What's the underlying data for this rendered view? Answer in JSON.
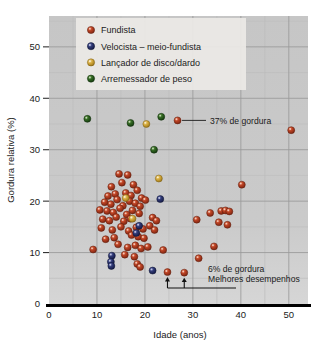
{
  "chart_data": {
    "type": "scatter",
    "title": "",
    "xlabel": "Idade (anos)",
    "ylabel": "Gordura relativa (%)",
    "xlim": [
      0,
      54
    ],
    "ylim": [
      0,
      56
    ],
    "xticks": [
      0,
      10,
      20,
      30,
      40,
      50
    ],
    "yticks": [
      0,
      10,
      20,
      30,
      40,
      50
    ],
    "grid": true,
    "grid_minor": true,
    "legend_position": "top-left",
    "plot_background": "#c9c9c9",
    "series": [
      {
        "name": "Fundista",
        "key": "fundista",
        "color": "#a8321e",
        "points": [
          [
            26.8,
            35.7
          ],
          [
            50.5,
            33.8
          ],
          [
            14.6,
            25.3
          ],
          [
            16.4,
            25.1
          ],
          [
            13.0,
            22.8
          ],
          [
            15.2,
            23.6
          ],
          [
            17.6,
            23.2
          ],
          [
            40.2,
            23.2
          ],
          [
            12.3,
            21.0
          ],
          [
            13.8,
            21.4
          ],
          [
            16.0,
            21.6
          ],
          [
            17.1,
            21.1
          ],
          [
            18.4,
            22.1
          ],
          [
            19.3,
            20.6
          ],
          [
            11.6,
            19.8
          ],
          [
            12.9,
            19.4
          ],
          [
            14.2,
            20.3
          ],
          [
            15.4,
            19.1
          ],
          [
            16.8,
            20.0
          ],
          [
            18.0,
            19.6
          ],
          [
            19.0,
            19.0
          ],
          [
            20.1,
            20.2
          ],
          [
            10.6,
            18.3
          ],
          [
            12.1,
            18.1
          ],
          [
            13.4,
            17.8
          ],
          [
            14.8,
            18.6
          ],
          [
            16.2,
            17.4
          ],
          [
            17.4,
            18.2
          ],
          [
            18.8,
            17.6
          ],
          [
            33.6,
            17.7
          ],
          [
            35.9,
            18.1
          ],
          [
            36.8,
            18.2
          ],
          [
            37.6,
            18.0
          ],
          [
            11.2,
            16.5
          ],
          [
            12.6,
            16.2
          ],
          [
            14.0,
            16.9
          ],
          [
            15.6,
            16.1
          ],
          [
            17.0,
            16.6
          ],
          [
            21.6,
            16.8
          ],
          [
            22.4,
            16.2
          ],
          [
            30.8,
            16.4
          ],
          [
            35.4,
            15.9
          ],
          [
            37.2,
            15.4
          ],
          [
            10.9,
            14.8
          ],
          [
            13.2,
            14.4
          ],
          [
            15.0,
            15.0
          ],
          [
            16.6,
            14.2
          ],
          [
            18.2,
            14.9
          ],
          [
            19.6,
            14.6
          ],
          [
            21.0,
            15.2
          ],
          [
            22.0,
            14.4
          ],
          [
            9.2,
            10.6
          ],
          [
            11.8,
            12.6
          ],
          [
            13.6,
            12.9
          ],
          [
            17.2,
            13.4
          ],
          [
            18.6,
            13.1
          ],
          [
            19.8,
            12.8
          ],
          [
            34.4,
            11.2
          ],
          [
            14.4,
            11.6
          ],
          [
            16.4,
            11.0
          ],
          [
            18.0,
            11.4
          ],
          [
            19.2,
            10.8
          ],
          [
            20.6,
            11.1
          ],
          [
            23.8,
            10.5
          ],
          [
            15.8,
            9.6
          ],
          [
            17.8,
            9.2
          ],
          [
            31.2,
            8.9
          ],
          [
            18.4,
            7.8
          ],
          [
            19.0,
            7.2
          ],
          [
            24.7,
            6.2
          ],
          [
            28.2,
            6.1
          ]
        ]
      },
      {
        "name": "Velocista – meio-fundista",
        "key": "velocista",
        "color": "#283069",
        "points": [
          [
            23.2,
            20.4
          ],
          [
            18.8,
            15.2
          ],
          [
            18.2,
            13.8
          ],
          [
            13.1,
            9.4
          ],
          [
            12.9,
            8.2
          ],
          [
            13.0,
            7.4
          ],
          [
            21.6,
            6.5
          ]
        ]
      },
      {
        "name": "Lançador de disco/dardo",
        "key": "lancador",
        "color": "#d2a83c",
        "points": [
          [
            22.9,
            24.4
          ],
          [
            16.0,
            20.6
          ],
          [
            17.4,
            16.6
          ],
          [
            20.3,
            35.0
          ]
        ]
      },
      {
        "name": "Arremessador de peso",
        "key": "arremessador",
        "color": "#2d5e1e",
        "points": [
          [
            8.0,
            36.0
          ],
          [
            17.0,
            35.2
          ],
          [
            23.4,
            36.4
          ],
          [
            21.9,
            30.0
          ]
        ]
      }
    ],
    "annotations": [
      {
        "key": "high-fat",
        "text": "37% de gordura",
        "target": [
          26.8,
          35.7
        ],
        "style": "leader-line-right"
      },
      {
        "key": "low-fat",
        "text_line1": "6% de gordura",
        "text_line2": "Melhores desempenhos",
        "targets": [
          [
            24.7,
            6.2
          ],
          [
            28.2,
            6.1
          ]
        ],
        "style": "double-arrow-up"
      }
    ]
  }
}
